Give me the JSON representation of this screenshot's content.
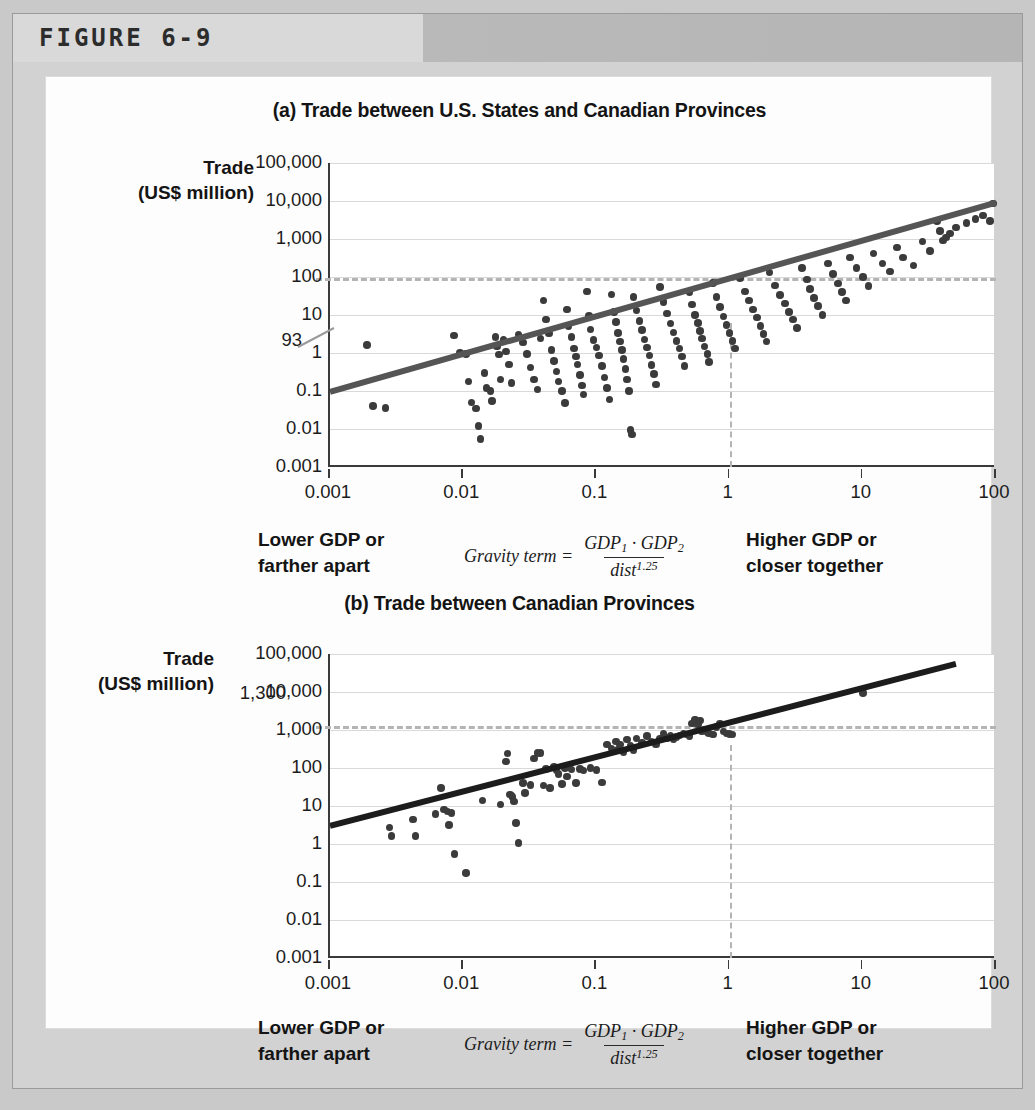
{
  "figure": {
    "label": "FIGURE 6-9"
  },
  "caption": {
    "left_line1": "Lower GDP or",
    "left_line2": "farther apart",
    "formula_lhs": "Gravity term =",
    "formula_num_a": "GDP",
    "formula_num_a_sub": "1",
    "formula_dot": "·",
    "formula_num_b": "GDP",
    "formula_num_b_sub": "2",
    "formula_den": "dist",
    "formula_den_exp": "1.25",
    "right_line1": "Higher GDP or",
    "right_line2": "closer together"
  },
  "axis_titles": {
    "y_line1": "Trade",
    "y_line2": "(US$ million)"
  },
  "chart_data": [
    {
      "id": "panel-a",
      "type": "scatter",
      "title": "(a) Trade between U.S. States and Canadian Provinces",
      "xlabel": "",
      "ylabel": "Trade (US$ million)",
      "xscale": "log",
      "yscale": "log",
      "xlim": [
        0.001,
        100
      ],
      "ylim": [
        0.001,
        100000
      ],
      "grid": true,
      "legend": "none",
      "xticks": [
        "0.001",
        "0.01",
        "0.1",
        "1",
        "10",
        "100"
      ],
      "yticks": [
        "100,000",
        "10,000",
        "1,000",
        "100",
        "10",
        "1",
        "0.1",
        "0.01",
        "0.001"
      ],
      "annotations": [
        {
          "label": "93",
          "type": "h-reference-line",
          "y_value": 93
        },
        {
          "label": "",
          "type": "v-reference-line",
          "x_value": 1
        }
      ],
      "trendline": {
        "x": [
          0.001,
          100
        ],
        "y": [
          0.095,
          9000
        ],
        "color": "#555555"
      },
      "points": [
        [
          0.0019,
          1.6
        ],
        [
          0.0021,
          0.04
        ],
        [
          0.0026,
          0.036
        ],
        [
          0.0085,
          2.9
        ],
        [
          0.0095,
          1.0
        ],
        [
          0.0105,
          0.95
        ],
        [
          0.011,
          0.18
        ],
        [
          0.0115,
          0.05
        ],
        [
          0.0125,
          0.035
        ],
        [
          0.013,
          0.012
        ],
        [
          0.0135,
          0.0055
        ],
        [
          0.0145,
          0.3
        ],
        [
          0.015,
          0.12
        ],
        [
          0.016,
          0.1
        ],
        [
          0.0165,
          0.055
        ],
        [
          0.0175,
          2.6
        ],
        [
          0.018,
          1.5
        ],
        [
          0.0185,
          0.9
        ],
        [
          0.019,
          0.2
        ],
        [
          0.02,
          2.2
        ],
        [
          0.021,
          1.1
        ],
        [
          0.022,
          0.5
        ],
        [
          0.023,
          0.16
        ],
        [
          0.026,
          3.1
        ],
        [
          0.028,
          1.9
        ],
        [
          0.03,
          0.95
        ],
        [
          0.032,
          0.42
        ],
        [
          0.034,
          0.2
        ],
        [
          0.036,
          0.11
        ],
        [
          0.038,
          2.4
        ],
        [
          0.04,
          24
        ],
        [
          0.042,
          7.5
        ],
        [
          0.044,
          3.3
        ],
        [
          0.046,
          1.2
        ],
        [
          0.048,
          0.62
        ],
        [
          0.05,
          0.33
        ],
        [
          0.052,
          0.18
        ],
        [
          0.055,
          0.1
        ],
        [
          0.058,
          0.048
        ],
        [
          0.06,
          14
        ],
        [
          0.062,
          5.2
        ],
        [
          0.065,
          2.6
        ],
        [
          0.068,
          1.3
        ],
        [
          0.07,
          0.8
        ],
        [
          0.072,
          0.5
        ],
        [
          0.075,
          0.26
        ],
        [
          0.078,
          0.14
        ],
        [
          0.08,
          0.08
        ],
        [
          0.085,
          42
        ],
        [
          0.088,
          9.5
        ],
        [
          0.09,
          4.2
        ],
        [
          0.095,
          2.2
        ],
        [
          0.1,
          1.4
        ],
        [
          0.105,
          0.85
        ],
        [
          0.11,
          0.45
        ],
        [
          0.115,
          0.23
        ],
        [
          0.12,
          0.12
        ],
        [
          0.125,
          0.06
        ],
        [
          0.13,
          35
        ],
        [
          0.135,
          12
        ],
        [
          0.14,
          6.5
        ],
        [
          0.145,
          3.4
        ],
        [
          0.15,
          2.0
        ],
        [
          0.155,
          1.2
        ],
        [
          0.16,
          0.7
        ],
        [
          0.165,
          0.38
        ],
        [
          0.17,
          0.2
        ],
        [
          0.175,
          0.1
        ],
        [
          0.18,
          0.0095
        ],
        [
          0.185,
          0.0072
        ],
        [
          0.19,
          30
        ],
        [
          0.2,
          13
        ],
        [
          0.21,
          7.0
        ],
        [
          0.22,
          4.0
        ],
        [
          0.23,
          2.3
        ],
        [
          0.24,
          1.4
        ],
        [
          0.25,
          0.85
        ],
        [
          0.26,
          0.48
        ],
        [
          0.27,
          0.28
        ],
        [
          0.28,
          0.15
        ],
        [
          0.3,
          55
        ],
        [
          0.32,
          22
        ],
        [
          0.34,
          11
        ],
        [
          0.36,
          6.0
        ],
        [
          0.38,
          3.5
        ],
        [
          0.4,
          2.1
        ],
        [
          0.42,
          1.3
        ],
        [
          0.44,
          0.8
        ],
        [
          0.46,
          0.46
        ],
        [
          0.5,
          40
        ],
        [
          0.52,
          19
        ],
        [
          0.55,
          10
        ],
        [
          0.58,
          6.2
        ],
        [
          0.6,
          3.8
        ],
        [
          0.62,
          2.4
        ],
        [
          0.65,
          1.5
        ],
        [
          0.68,
          0.95
        ],
        [
          0.7,
          0.58
        ],
        [
          0.75,
          70
        ],
        [
          0.8,
          30
        ],
        [
          0.85,
          16
        ],
        [
          0.9,
          9.0
        ],
        [
          0.95,
          5.5
        ],
        [
          1.0,
          3.4
        ],
        [
          1.05,
          2.1
        ],
        [
          1.1,
          1.3
        ],
        [
          1.2,
          95
        ],
        [
          1.3,
          42
        ],
        [
          1.4,
          24
        ],
        [
          1.5,
          14
        ],
        [
          1.6,
          8.5
        ],
        [
          1.7,
          5.2
        ],
        [
          1.8,
          3.2
        ],
        [
          1.9,
          2.0
        ],
        [
          2.0,
          130
        ],
        [
          2.2,
          60
        ],
        [
          2.4,
          34
        ],
        [
          2.6,
          20
        ],
        [
          2.8,
          12
        ],
        [
          3.0,
          7.5
        ],
        [
          3.2,
          4.6
        ],
        [
          3.5,
          170
        ],
        [
          3.8,
          85
        ],
        [
          4.0,
          48
        ],
        [
          4.3,
          28
        ],
        [
          4.6,
          17
        ],
        [
          5.0,
          10
        ],
        [
          5.5,
          230
        ],
        [
          6.0,
          120
        ],
        [
          6.5,
          68
        ],
        [
          7.0,
          40
        ],
        [
          7.5,
          24
        ],
        [
          8.0,
          330
        ],
        [
          9.0,
          170
        ],
        [
          10,
          100
        ],
        [
          11,
          58
        ],
        [
          12,
          420
        ],
        [
          14,
          230
        ],
        [
          16,
          140
        ],
        [
          18,
          600
        ],
        [
          20,
          330
        ],
        [
          24,
          200
        ],
        [
          28,
          850
        ],
        [
          32,
          480
        ],
        [
          36,
          3000
        ],
        [
          38,
          1600
        ],
        [
          40,
          900
        ],
        [
          42,
          1100
        ],
        [
          45,
          1400
        ],
        [
          50,
          2000
        ],
        [
          60,
          2600
        ],
        [
          70,
          3400
        ],
        [
          80,
          4200
        ],
        [
          90,
          3000
        ],
        [
          95,
          8500
        ]
      ]
    },
    {
      "id": "panel-b",
      "type": "scatter",
      "title": "(b) Trade between Canadian Provinces",
      "xlabel": "",
      "ylabel": "Trade (US$ million)",
      "xscale": "log",
      "yscale": "log",
      "xlim": [
        0.001,
        100
      ],
      "ylim": [
        0.001,
        100000
      ],
      "grid": true,
      "legend": "none",
      "xticks": [
        "0.001",
        "0.01",
        "0.1",
        "1",
        "10",
        "100"
      ],
      "yticks": [
        "100,000",
        "10,000",
        "1,000",
        "100",
        "10",
        "1",
        "0.1",
        "0.01",
        "0.001"
      ],
      "annotations": [
        {
          "label": "1,300",
          "type": "h-reference-line",
          "y_value": 1300
        },
        {
          "label": "",
          "type": "v-reference-line",
          "x_value": 1
        }
      ],
      "trendline": {
        "x": [
          0.001,
          50
        ],
        "y": [
          3.0,
          55000
        ],
        "color": "#1c1c1c"
      },
      "points": [
        [
          0.0028,
          2.7
        ],
        [
          0.0029,
          1.6
        ],
        [
          0.0042,
          4.4
        ],
        [
          0.0044,
          1.6
        ],
        [
          0.0062,
          6.2
        ],
        [
          0.0068,
          30
        ],
        [
          0.0072,
          8.0
        ],
        [
          0.0076,
          7.2
        ],
        [
          0.0078,
          3.2
        ],
        [
          0.0082,
          6.6
        ],
        [
          0.0086,
          0.55
        ],
        [
          0.0105,
          0.17
        ],
        [
          0.014,
          14
        ],
        [
          0.019,
          11
        ],
        [
          0.021,
          150
        ],
        [
          0.0215,
          240
        ],
        [
          0.0225,
          20
        ],
        [
          0.023,
          19
        ],
        [
          0.0235,
          17
        ],
        [
          0.024,
          13
        ],
        [
          0.025,
          3.6
        ],
        [
          0.026,
          1.05
        ],
        [
          0.028,
          40
        ],
        [
          0.029,
          22
        ],
        [
          0.032,
          36
        ],
        [
          0.034,
          180
        ],
        [
          0.036,
          250
        ],
        [
          0.038,
          250
        ],
        [
          0.04,
          35
        ],
        [
          0.042,
          95
        ],
        [
          0.045,
          30
        ],
        [
          0.048,
          105
        ],
        [
          0.05,
          85
        ],
        [
          0.052,
          70
        ],
        [
          0.055,
          38
        ],
        [
          0.058,
          100
        ],
        [
          0.06,
          60
        ],
        [
          0.065,
          90
        ],
        [
          0.07,
          40
        ],
        [
          0.075,
          95
        ],
        [
          0.08,
          85
        ],
        [
          0.09,
          100
        ],
        [
          0.1,
          88
        ],
        [
          0.11,
          42
        ],
        [
          0.12,
          420
        ],
        [
          0.13,
          330
        ],
        [
          0.14,
          500
        ],
        [
          0.145,
          300
        ],
        [
          0.15,
          420
        ],
        [
          0.16,
          260
        ],
        [
          0.17,
          560
        ],
        [
          0.18,
          380
        ],
        [
          0.19,
          300
        ],
        [
          0.2,
          600
        ],
        [
          0.22,
          450
        ],
        [
          0.24,
          700
        ],
        [
          0.26,
          500
        ],
        [
          0.28,
          420
        ],
        [
          0.3,
          600
        ],
        [
          0.32,
          800
        ],
        [
          0.34,
          620
        ],
        [
          0.36,
          700
        ],
        [
          0.38,
          560
        ],
        [
          0.4,
          650
        ],
        [
          0.42,
          720
        ],
        [
          0.45,
          820
        ],
        [
          0.48,
          760
        ],
        [
          0.5,
          700
        ],
        [
          0.52,
          1500
        ],
        [
          0.55,
          1900
        ],
        [
          0.58,
          1400
        ],
        [
          0.6,
          1800
        ],
        [
          0.62,
          900
        ],
        [
          0.65,
          1000
        ],
        [
          0.68,
          850
        ],
        [
          0.7,
          820
        ],
        [
          0.75,
          760
        ],
        [
          0.8,
          1200
        ],
        [
          0.85,
          1500
        ],
        [
          0.9,
          900
        ],
        [
          0.95,
          800
        ],
        [
          1.0,
          780
        ],
        [
          1.05,
          760
        ],
        [
          10,
          9500
        ]
      ]
    }
  ]
}
